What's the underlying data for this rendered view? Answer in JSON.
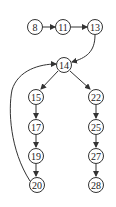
{
  "diagram": {
    "type": "directed-graph",
    "colors": {
      "stroke": "#333333",
      "node_fill": "#ffffff",
      "text": "#222222",
      "background": "#ffffff"
    },
    "nodes": [
      {
        "id": "n8",
        "label": "8",
        "x": 35,
        "y": 27
      },
      {
        "id": "n11",
        "label": "11",
        "x": 63,
        "y": 27
      },
      {
        "id": "n13",
        "label": "13",
        "x": 95,
        "y": 27
      },
      {
        "id": "n14",
        "label": "14",
        "x": 64,
        "y": 65
      },
      {
        "id": "n15",
        "label": "15",
        "x": 36,
        "y": 97
      },
      {
        "id": "n17",
        "label": "17",
        "x": 36,
        "y": 127
      },
      {
        "id": "n19",
        "label": "19",
        "x": 36,
        "y": 156
      },
      {
        "id": "n20",
        "label": "20",
        "x": 37,
        "y": 185
      },
      {
        "id": "n22",
        "label": "22",
        "x": 96,
        "y": 97
      },
      {
        "id": "n25",
        "label": "25",
        "x": 96,
        "y": 127
      },
      {
        "id": "n27",
        "label": "27",
        "x": 96,
        "y": 156
      },
      {
        "id": "n28",
        "label": "28",
        "x": 96,
        "y": 185
      }
    ],
    "edges": [
      {
        "from": "8",
        "to": "11"
      },
      {
        "from": "11",
        "to": "13"
      },
      {
        "from": "13",
        "to": "14"
      },
      {
        "from": "14",
        "to": "15"
      },
      {
        "from": "14",
        "to": "22"
      },
      {
        "from": "15",
        "to": "17"
      },
      {
        "from": "17",
        "to": "19"
      },
      {
        "from": "19",
        "to": "20"
      },
      {
        "from": "20",
        "to": "14"
      },
      {
        "from": "22",
        "to": "25"
      },
      {
        "from": "25",
        "to": "27"
      },
      {
        "from": "27",
        "to": "28"
      }
    ]
  }
}
